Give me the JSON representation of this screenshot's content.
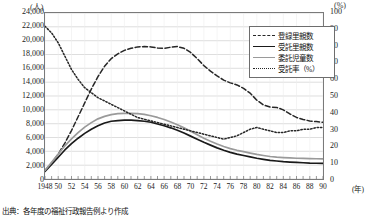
{
  "axes": {
    "left_unit": "(人)",
    "right_unit": "(%)",
    "x_unit": "(年)",
    "y_left_ticks": [
      "24,000",
      "22,000",
      "20,000",
      "18,000",
      "16,000",
      "14,000",
      "12,000",
      "10,000",
      "8,000",
      "6,000",
      "4,000",
      "2,000",
      "0"
    ],
    "y_right_ticks": [
      "100",
      "90",
      "80",
      "70",
      "60",
      "50",
      "40",
      "30",
      "20",
      "10",
      "0"
    ],
    "x_ticks": [
      "1948",
      "50",
      "52",
      "54",
      "56",
      "58",
      "60",
      "62",
      "64",
      "66",
      "68",
      "70",
      "72",
      "74",
      "76",
      "78",
      "80",
      "82",
      "84",
      "86",
      "88",
      "90"
    ]
  },
  "legend": {
    "items": [
      {
        "label": "登録里親数",
        "key": "dash"
      },
      {
        "label": "受託里親数",
        "key": "solid-black"
      },
      {
        "label": "委託児童数",
        "key": "solid-gray"
      },
      {
        "label": "受託率（%）",
        "key": "dot"
      }
    ]
  },
  "caption": "出典：各年度の福祉行政報告例より作成",
  "chart_data": {
    "type": "line",
    "title": "",
    "xlabel": "(年)",
    "ylabel": "(人)",
    "y2label": "(%)",
    "ylim": [
      0,
      24000
    ],
    "y2lim": [
      0,
      100
    ],
    "xlim": [
      1948,
      1990
    ],
    "grid": true,
    "legend_position": "top-right",
    "x": [
      1948,
      1949,
      1950,
      1951,
      1952,
      1953,
      1954,
      1955,
      1956,
      1957,
      1958,
      1959,
      1960,
      1961,
      1962,
      1963,
      1964,
      1965,
      1966,
      1967,
      1968,
      1969,
      1970,
      1971,
      1972,
      1973,
      1974,
      1975,
      1976,
      1977,
      1978,
      1979,
      1980,
      1981,
      1982,
      1983,
      1984,
      1985,
      1986,
      1987,
      1988,
      1989,
      1990
    ],
    "series": [
      {
        "name": "登録里親数",
        "axis": "left",
        "style": "dashed",
        "color": "#262626",
        "values": [
          1200,
          2300,
          3600,
          5200,
          7000,
          9000,
          11000,
          13000,
          14800,
          16300,
          17400,
          18100,
          18600,
          18900,
          19100,
          19150,
          19100,
          18950,
          18900,
          19050,
          19150,
          18900,
          18300,
          17400,
          16400,
          15600,
          14900,
          14300,
          13900,
          13600,
          13100,
          12400,
          11400,
          10700,
          10400,
          10350,
          10000,
          9400,
          8900,
          8600,
          8400,
          8300,
          8200
        ]
      },
      {
        "name": "受託里親数",
        "axis": "left",
        "style": "solid",
        "color": "#1a1a1a",
        "values": [
          1100,
          2100,
          3150,
          4200,
          5100,
          5900,
          6600,
          7200,
          7700,
          8100,
          8350,
          8450,
          8500,
          8500,
          8450,
          8350,
          8200,
          7950,
          7700,
          7400,
          7050,
          6650,
          6200,
          5750,
          5300,
          4900,
          4500,
          4150,
          3850,
          3600,
          3400,
          3200,
          3000,
          2850,
          2700,
          2600,
          2500,
          2450,
          2400,
          2350,
          2300,
          2280,
          2250
        ]
      },
      {
        "name": "委託児童数",
        "axis": "left",
        "style": "solid",
        "color": "#9a9a9a",
        "values": [
          1250,
          2400,
          3600,
          4800,
          5800,
          6700,
          7500,
          8150,
          8700,
          9050,
          9300,
          9450,
          9500,
          9500,
          9450,
          9350,
          9150,
          8900,
          8600,
          8250,
          7850,
          7400,
          6900,
          6400,
          5900,
          5450,
          5050,
          4700,
          4400,
          4150,
          3950,
          3750,
          3550,
          3400,
          3250,
          3150,
          3100,
          3050,
          3000,
          2980,
          2950,
          2930,
          2900
        ]
      },
      {
        "name": "受託率（%）",
        "axis": "right",
        "style": "dotted",
        "color": "#262626",
        "values": [
          92,
          88,
          82,
          74,
          66,
          60,
          55,
          52,
          49,
          47,
          45,
          43,
          41,
          39,
          37,
          36,
          35,
          34,
          33,
          32,
          31,
          30,
          29,
          28,
          27,
          26,
          25,
          24,
          25,
          26,
          28,
          30,
          31,
          30,
          29,
          28,
          28,
          29,
          29,
          30,
          30,
          31,
          31
        ]
      }
    ]
  }
}
